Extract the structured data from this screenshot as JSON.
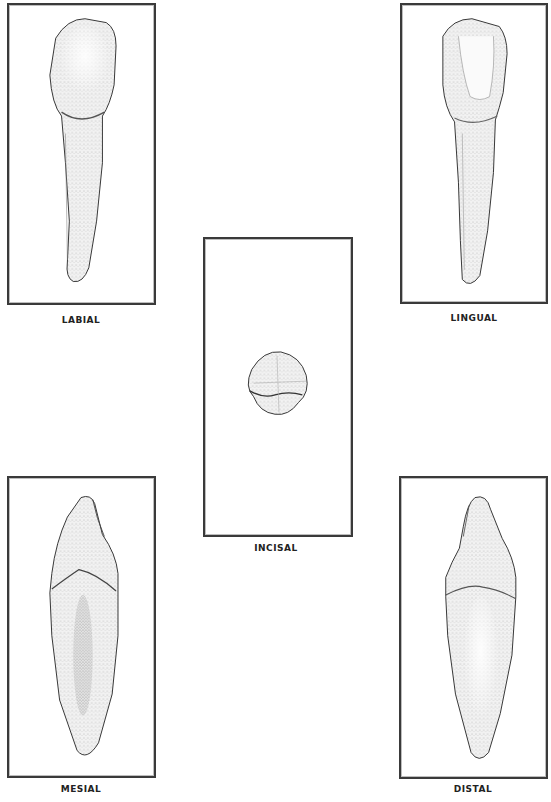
{
  "figure": {
    "views": [
      {
        "id": "labial",
        "label": "LABIAL"
      },
      {
        "id": "lingual",
        "label": "LINGUAL"
      },
      {
        "id": "incisal",
        "label": "INCISAL"
      },
      {
        "id": "mesial",
        "label": "MESIAL"
      },
      {
        "id": "distal",
        "label": "DISTAL"
      }
    ],
    "colors": {
      "frame": "#3a3a3a",
      "stipple": "#555555",
      "background": "#ffffff"
    }
  }
}
